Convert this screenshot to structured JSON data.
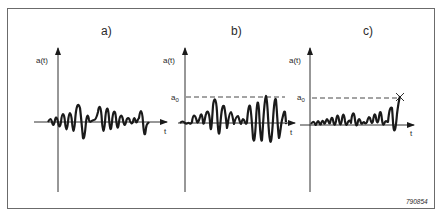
{
  "figure": {
    "id_label": "790854",
    "stroke_color": "#1a1a1a",
    "frame_color": "#6b6b6b",
    "panels": [
      {
        "label": "a)",
        "y_axis_label": "a(t)",
        "x_axis_label": "t",
        "threshold_label": "",
        "description": "Random oscillating signal a(t) around zero, no threshold"
      },
      {
        "label": "b)",
        "y_axis_label": "a(t)",
        "x_axis_label": "t",
        "threshold_label": "a",
        "threshold_sub": "0",
        "description": "Signal with peaks touching dashed threshold level a0"
      },
      {
        "label": "c)",
        "y_axis_label": "a(t)",
        "x_axis_label": "t",
        "threshold_label": "a",
        "threshold_sub": "0",
        "description": "Signal exceeds threshold a0 at end, marked with X"
      }
    ]
  }
}
